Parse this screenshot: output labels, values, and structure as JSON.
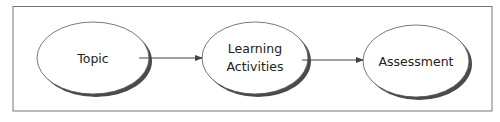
{
  "diagram": {
    "type": "flowchart",
    "direction": "left-to-right",
    "nodes": [
      {
        "id": "topic",
        "label_lines": [
          "Topic"
        ],
        "shape": "ellipse"
      },
      {
        "id": "learning_activities",
        "label_lines": [
          "Learning",
          "Activities"
        ],
        "shape": "ellipse"
      },
      {
        "id": "assessment",
        "label_lines": [
          "Assessment"
        ],
        "shape": "ellipse"
      }
    ],
    "edges": [
      {
        "from": "topic",
        "to": "learning_activities"
      },
      {
        "from": "learning_activities",
        "to": "assessment"
      }
    ]
  },
  "colors": {
    "frame": "#777777",
    "ellipse_stroke": "#555555",
    "ellipse_fill": "#ffffff",
    "shadow": "#4a4a4a",
    "arrow": "#444444",
    "text": "#222222"
  }
}
